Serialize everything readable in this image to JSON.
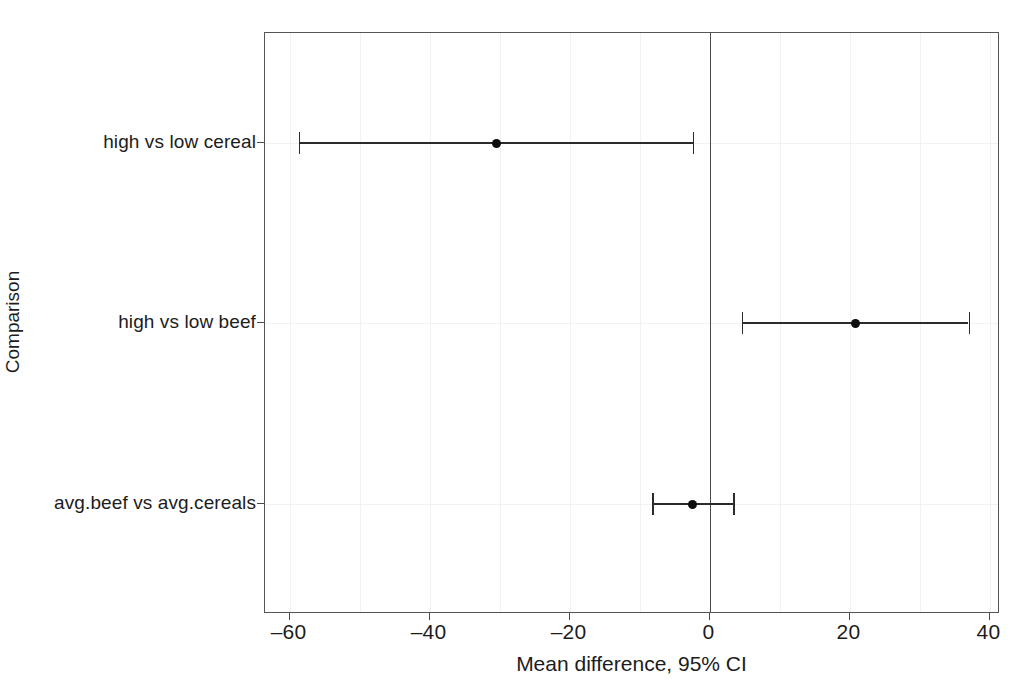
{
  "figure": {
    "title_remnant": "",
    "background_color": "#ffffff",
    "frame_color": "#555555",
    "marker_color": "#0d0d0d",
    "zero_line_color": "#4a4a4a"
  },
  "chart_data": {
    "type": "scatter",
    "subtype": "forest-plot",
    "title": "",
    "xlabel": "Mean difference, 95% CI",
    "ylabel": "Comparison",
    "xlim": [
      -63.5,
      41.5
    ],
    "xticks": [
      -60,
      -40,
      -20,
      0,
      20,
      40
    ],
    "xtick_labels": [
      "–60",
      "–40",
      "–20",
      "0",
      "20",
      "40"
    ],
    "grid": "faint-vertical-and-horizontal",
    "legend": "none",
    "reference_line": 0,
    "categories": [
      "high vs low cereal",
      "high vs low beef",
      "avg.beef vs avg.cereals"
    ],
    "points": [
      {
        "label": "high vs low cereal",
        "estimate": -30.4,
        "ci_low": -58.7,
        "ci_high": -2.4
      },
      {
        "label": "high vs low beef",
        "estimate": 20.8,
        "ci_low": 4.6,
        "ci_high": 37.0
      },
      {
        "label": "avg.beef vs avg.cereals",
        "estimate": -2.4,
        "ci_low": -8.2,
        "ci_high": 3.4
      }
    ]
  }
}
